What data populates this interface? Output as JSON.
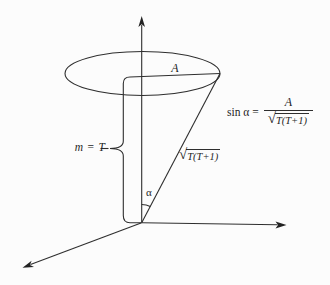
{
  "figure": {
    "background": "#fcfcfc",
    "line_color": "#2e2e2e",
    "text_color": "#1f1f1f"
  },
  "labels": {
    "radius": "A",
    "projection": "m = T",
    "angle": "α",
    "slant": {
      "radical": "√",
      "radicand": "T(T+1)"
    },
    "formula": {
      "lhs": "sin α =",
      "numerator": "A",
      "radical": "√",
      "radicand": "T(T+1)"
    }
  }
}
